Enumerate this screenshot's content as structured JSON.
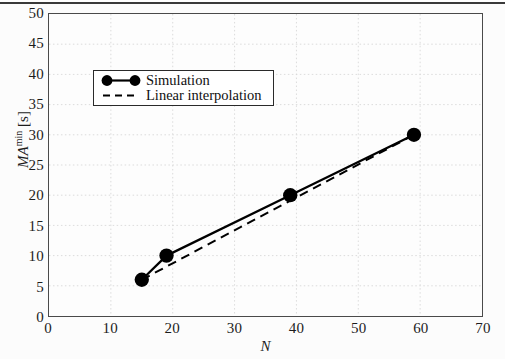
{
  "chart_data": {
    "type": "line",
    "title": "",
    "xlabel": "N",
    "ylabel": "MA^min [s]",
    "ylabel_base": "MA",
    "ylabel_sup": "min",
    "ylabel_unit": " [s]",
    "xlim": [
      0,
      70
    ],
    "ylim": [
      0,
      50
    ],
    "xticks": [
      0,
      10,
      20,
      30,
      40,
      50,
      60,
      70
    ],
    "yticks": [
      0,
      5,
      10,
      15,
      20,
      25,
      30,
      35,
      40,
      45,
      50
    ],
    "xtick_labels": [
      "0",
      "10",
      "20",
      "30",
      "40",
      "50",
      "60",
      "70"
    ],
    "ytick_labels": [
      "0",
      "5",
      "10",
      "15",
      "20",
      "25",
      "30",
      "35",
      "40",
      "45",
      "50"
    ],
    "grid": true,
    "grid_style": "dotted",
    "legend_position": "upper-left",
    "series": [
      {
        "name": "Simulation",
        "style": "solid",
        "marker": "filled-circle",
        "color": "#000000",
        "x": [
          15,
          19,
          39,
          59
        ],
        "y": [
          6,
          10,
          20,
          30
        ]
      },
      {
        "name": "Linear interpolation",
        "style": "dashed",
        "marker": "none",
        "color": "#000000",
        "x": [
          15,
          59
        ],
        "y": [
          6,
          30
        ]
      }
    ]
  },
  "legend": {
    "items": [
      {
        "label": "Simulation"
      },
      {
        "label": "Linear interpolation"
      }
    ]
  },
  "colors": {
    "axis": "#4a4a4a",
    "grid": "#d8d8d8",
    "data": "#000000",
    "text": "#1c1c1c",
    "background": "#fdfdfd"
  }
}
